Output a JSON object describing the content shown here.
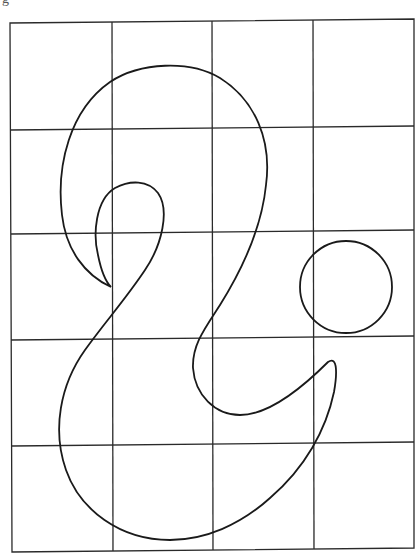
{
  "figure": {
    "label": "g",
    "grid": {
      "columns": 4,
      "rows": 5
    },
    "shapes": [
      "main-curve",
      "circle"
    ]
  }
}
